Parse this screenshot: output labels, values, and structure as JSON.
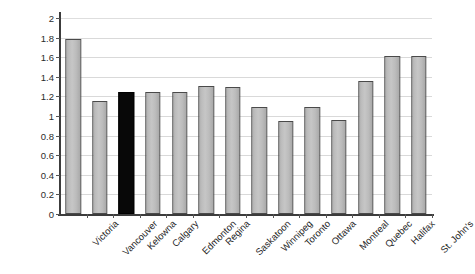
{
  "chart_data": {
    "type": "bar",
    "title": "",
    "subtitle": "",
    "xlabel": "",
    "ylabel": "No. of physicians",
    "ylim": [
      0,
      2
    ],
    "ytick_labels": [
      "0",
      "0.2",
      "0.4",
      "0.6",
      "0.8",
      "1",
      "1.2",
      "1.4",
      "1.6",
      "1.8",
      "2"
    ],
    "ytick_values": [
      0,
      0.2,
      0.4,
      0.6,
      0.8,
      1,
      1.2,
      1.4,
      1.6,
      1.8,
      2
    ],
    "grid": true,
    "legend": false,
    "legend_position": "none",
    "categories": [
      "Victoria",
      "Vancouver",
      "Kelowna",
      "Calgary",
      "Edmonton",
      "Regina",
      "Saskatoon",
      "Winnipeg",
      "Toronto",
      "Ottawa",
      "Montreal",
      "Quebec",
      "Halifax",
      "St. John's"
    ],
    "values": [
      1.79,
      1.15,
      1.24,
      1.25,
      1.24,
      1.31,
      1.3,
      1.09,
      0.95,
      1.09,
      0.96,
      1.36,
      1.61,
      1.61
    ],
    "highlight_index": 2,
    "highlight_category": "Kelowna",
    "colors": {
      "bar_fill": "#c0c0c0",
      "bar_border": "#4a4a4a",
      "highlight_fill": "#080808",
      "gridline": "#d9d9d9",
      "axis_line": "#3c3c3c",
      "background": "#ffffff",
      "text": "#1f1f1f"
    }
  }
}
